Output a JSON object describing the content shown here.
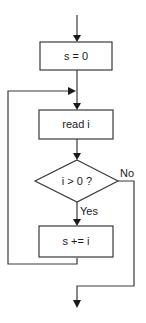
{
  "diagram": {
    "type": "flowchart",
    "nodes": [
      {
        "id": "init",
        "shape": "rectangle",
        "label": "s = 0"
      },
      {
        "id": "read",
        "shape": "rectangle",
        "label": "read i"
      },
      {
        "id": "check",
        "shape": "diamond",
        "label": "i > 0 ?"
      },
      {
        "id": "accum",
        "shape": "rectangle",
        "label": "s += i"
      }
    ],
    "edges": [
      {
        "from": "start",
        "to": "init",
        "label": ""
      },
      {
        "from": "init",
        "to": "read",
        "label": ""
      },
      {
        "from": "read",
        "to": "check",
        "label": ""
      },
      {
        "from": "check",
        "to": "accum",
        "label": "Yes"
      },
      {
        "from": "accum",
        "to": "read",
        "label": ""
      },
      {
        "from": "check",
        "to": "end",
        "label": "No"
      }
    ]
  }
}
